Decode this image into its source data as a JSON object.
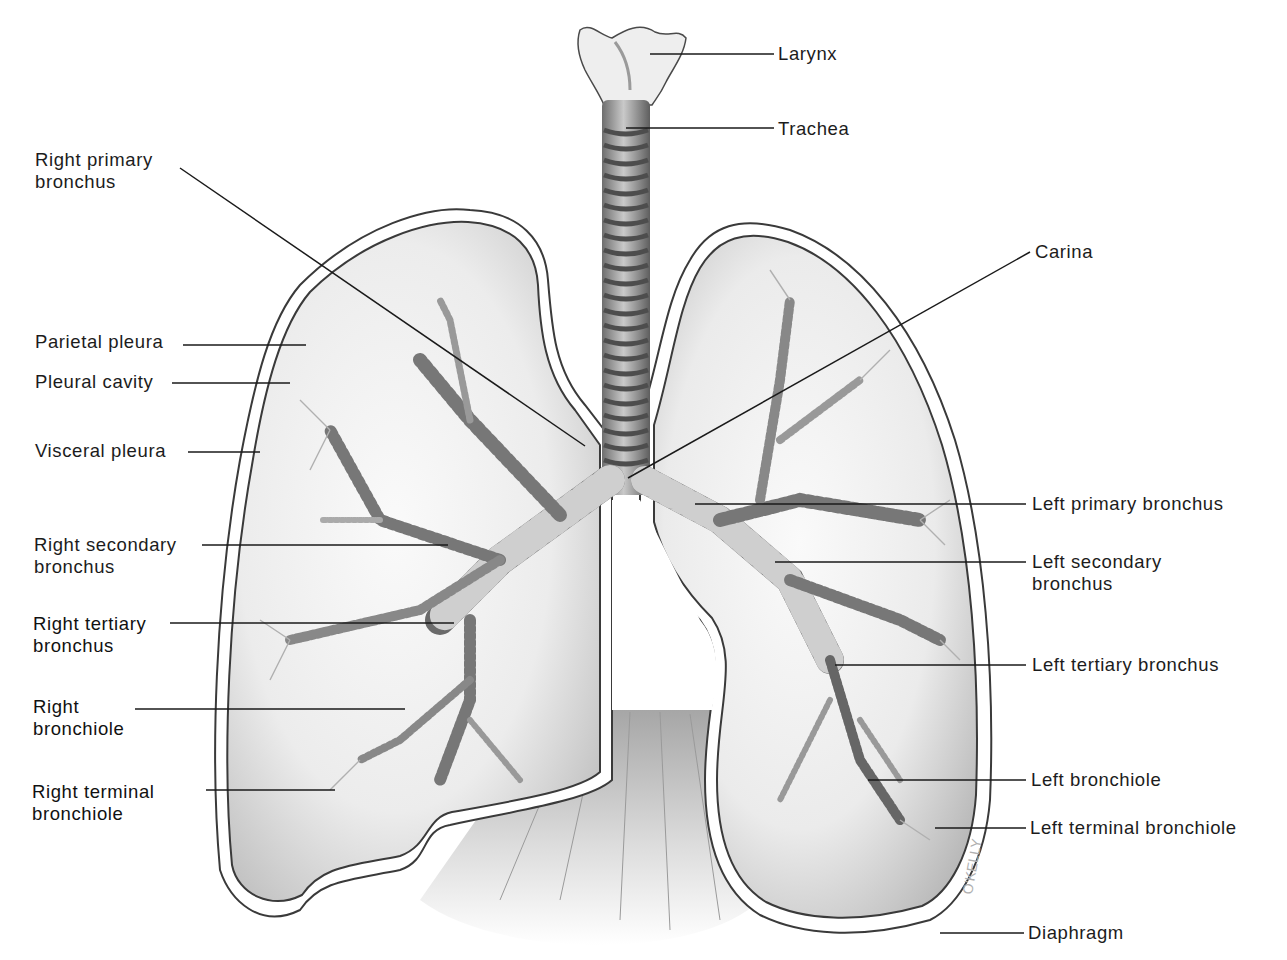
{
  "diagram": {
    "signature": "O'KELLY",
    "colors": {
      "background": "#ffffff",
      "outline": "#3a3a3a",
      "lung_fill": "#ececec",
      "lung_shade": "#b8b8b8",
      "bronchus_ring": "#5a5a5a",
      "leader_line": "#1a1a1a",
      "label_text": "#1c1c1c"
    }
  },
  "labels": {
    "larynx": "Larynx",
    "trachea": "Trachea",
    "carina": "Carina",
    "right_primary_bronchus": "Right primary\nbronchus",
    "parietal_pleura": "Parietal pleura",
    "pleural_cavity": "Pleural cavity",
    "visceral_pleura": "Visceral pleura",
    "right_secondary_bronchus": "Right secondary\nbronchus",
    "right_tertiary_bronchus": "Right tertiary\nbronchus",
    "right_bronchiole": "Right\nbronchiole",
    "right_terminal_bronchiole": "Right terminal\nbronchiole",
    "left_primary_bronchus": "Left primary bronchus",
    "left_secondary_bronchus": "Left secondary\nbronchus",
    "left_tertiary_bronchus": "Left tertiary bronchus",
    "left_bronchiole": "Left bronchiole",
    "left_terminal_bronchiole": "Left terminal bronchiole",
    "diaphragm": "Diaphragm"
  }
}
